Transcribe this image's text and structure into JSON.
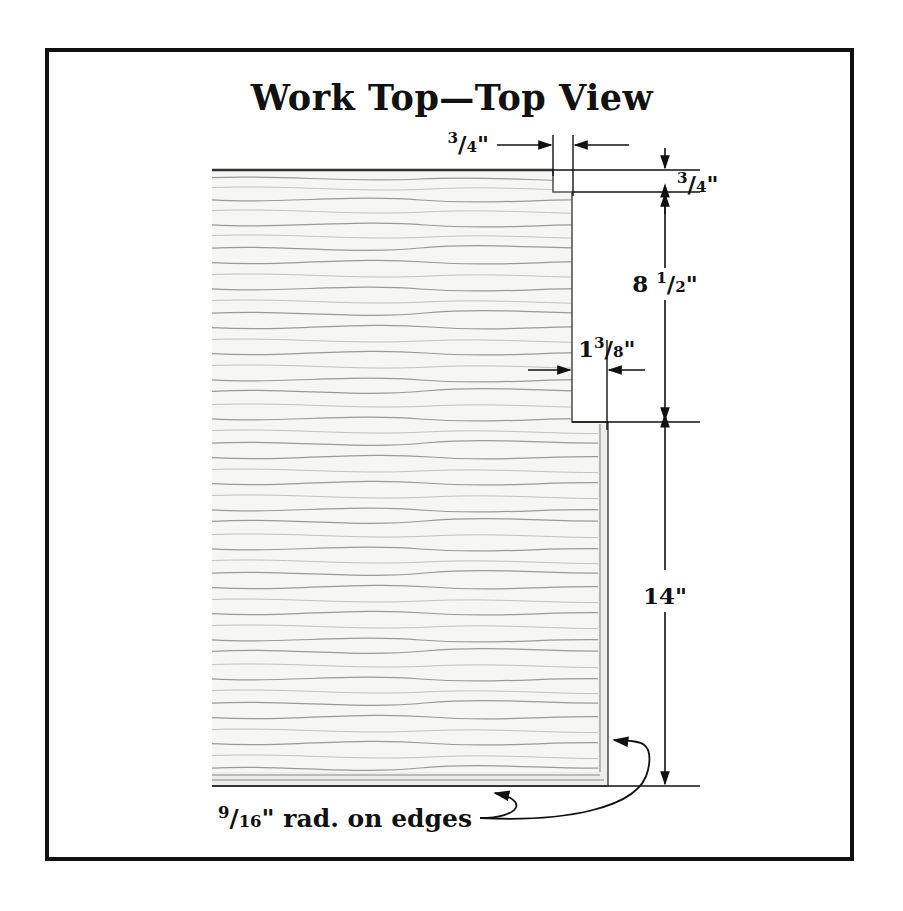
{
  "document": {
    "title": "Work Top—Top View",
    "type": "technical-drawing",
    "subject": "wood work top plan view with notched corner"
  },
  "frame": {
    "border_color": "#111111",
    "background_color": "#ffffff"
  },
  "part": {
    "material": "wood",
    "grain_color": "#9a9a9a",
    "fill_color": "#f6f6f4",
    "outline_color": "#555555"
  },
  "dimensions": [
    {
      "id": "notch-width-top",
      "label": "3/4\"",
      "whole": "",
      "numerator": "3",
      "denominator": "4",
      "unit": "\"",
      "orientation": "horizontal",
      "value_inches": 0.75,
      "describes": "notch shoulder width at top edge"
    },
    {
      "id": "notch-depth-top",
      "label": "3/4\"",
      "whole": "",
      "numerator": "3",
      "denominator": "4",
      "unit": "\"",
      "orientation": "vertical",
      "value_inches": 0.75,
      "describes": "notch depth from top edge"
    },
    {
      "id": "upper-section-height",
      "label": "8 1/2\"",
      "whole": "8",
      "numerator": "1",
      "denominator": "2",
      "unit": "\"",
      "orientation": "vertical",
      "value_inches": 8.5,
      "describes": "height of narrow upper section"
    },
    {
      "id": "notch-offset",
      "label": "1 3/8\"",
      "whole": "1",
      "numerator": "3",
      "denominator": "8",
      "unit": "\"",
      "orientation": "horizontal",
      "value_inches": 1.375,
      "describes": "step-out width at lower shoulder"
    },
    {
      "id": "lower-section-height",
      "label": "14\"",
      "whole": "14",
      "numerator": "",
      "denominator": "",
      "unit": "\"",
      "orientation": "vertical",
      "value_inches": 14,
      "describes": "height of full-width lower section"
    }
  ],
  "notes": [
    {
      "id": "edge-radius-note",
      "prefix_numerator": "9",
      "prefix_denominator": "16",
      "text": "\" rad. on edges",
      "full_text": "9/16\" rad. on edges",
      "value_inches": 0.5625,
      "leader_targets": [
        "bottom edge",
        "right edge"
      ]
    }
  ]
}
